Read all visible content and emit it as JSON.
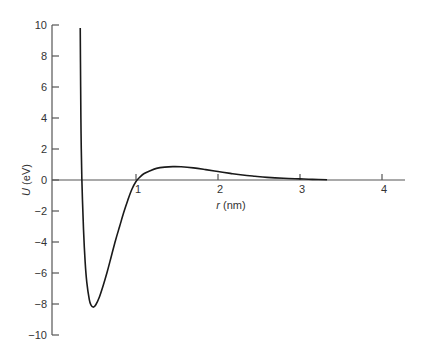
{
  "chart_data": {
    "type": "line",
    "title": "",
    "xlabel_var": "r",
    "xlabel_unit": " (nm)",
    "ylabel_var": "U",
    "ylabel_unit": " (eV)",
    "xlim": [
      0,
      4.3
    ],
    "ylim": [
      -10,
      10
    ],
    "grid": false,
    "legend": null,
    "x_ticks": [
      1,
      2,
      3,
      4
    ],
    "x_tick_labels": [
      "1",
      "2",
      "3",
      "4"
    ],
    "y_ticks": [
      10,
      8,
      6,
      4,
      2,
      0,
      -2,
      -4,
      -6,
      -8,
      -10
    ],
    "y_tick_labels": [
      "10",
      "8",
      "6",
      "4",
      "2",
      "0",
      "−2",
      "−4",
      "−6",
      "−8",
      "−10"
    ],
    "series": [
      {
        "name": "U(r)",
        "color": "#1a1a1a",
        "x": [
          0.32,
          0.325,
          0.33,
          0.34,
          0.36,
          0.38,
          0.4,
          0.43,
          0.45,
          0.48,
          0.51,
          0.55,
          0.6,
          0.65,
          0.7,
          0.75,
          0.8,
          0.85,
          0.9,
          0.95,
          1.0,
          1.05,
          1.1,
          1.18,
          1.25,
          1.35,
          1.45,
          1.55,
          1.7,
          1.85,
          2.0,
          2.15,
          2.3,
          2.45,
          2.6,
          2.8,
          3.0,
          3.15,
          3.33
        ],
        "y": [
          9.8,
          6.0,
          3.0,
          0.0,
          -3.2,
          -5.3,
          -6.6,
          -7.7,
          -8.05,
          -8.2,
          -8.05,
          -7.6,
          -6.8,
          -5.9,
          -4.9,
          -3.9,
          -3.0,
          -2.1,
          -1.3,
          -0.6,
          -0.1,
          0.2,
          0.42,
          0.62,
          0.75,
          0.83,
          0.86,
          0.85,
          0.78,
          0.67,
          0.55,
          0.43,
          0.32,
          0.24,
          0.17,
          0.11,
          0.07,
          0.04,
          0.02
        ]
      }
    ]
  }
}
